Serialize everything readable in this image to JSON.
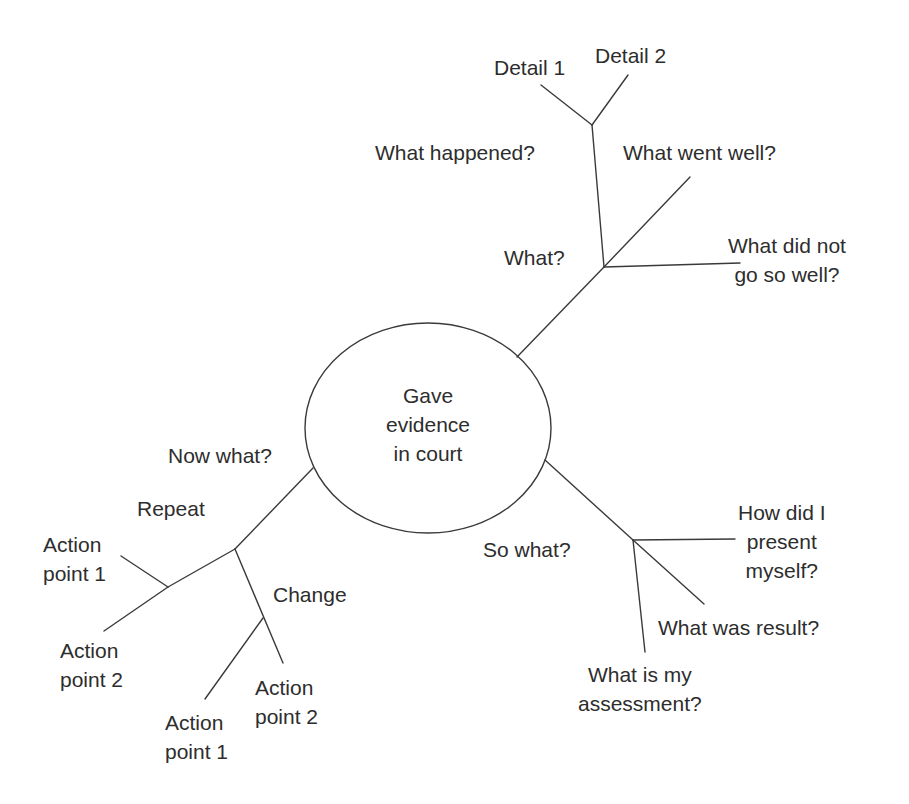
{
  "diagram": {
    "type": "mind-map",
    "center": {
      "lines": [
        "Gave",
        "evidence",
        "in court"
      ]
    },
    "branches": {
      "what": {
        "label": "What?",
        "children": {
          "what_happened": {
            "label": "What happened?",
            "children": {
              "detail_1": "Detail 1",
              "detail_2": "Detail 2"
            }
          },
          "what_went_well": "What went well?",
          "what_did_not": {
            "lines": [
              "What did not",
              "go so well?"
            ]
          }
        }
      },
      "so_what": {
        "label": "So what?",
        "children": {
          "how_present": {
            "lines": [
              "How did I",
              "present",
              "myself?"
            ]
          },
          "result": "What was result?",
          "assessment": {
            "lines": [
              "What is my",
              "assessment?"
            ]
          }
        }
      },
      "now_what": {
        "label": "Now what?",
        "children": {
          "repeat": {
            "label": "Repeat",
            "children": {
              "ap1": {
                "lines": [
                  "Action",
                  "point 1"
                ]
              },
              "ap2": {
                "lines": [
                  "Action",
                  "point 2"
                ]
              }
            }
          },
          "change": {
            "label": "Change",
            "children": {
              "ap1": {
                "lines": [
                  "Action",
                  "point 1"
                ]
              },
              "ap2": {
                "lines": [
                  "Action",
                  "point 2"
                ]
              }
            }
          }
        }
      }
    },
    "colors": {
      "line": "#3a3a3a",
      "text": "#2d2d2d",
      "background": "#ffffff"
    }
  }
}
